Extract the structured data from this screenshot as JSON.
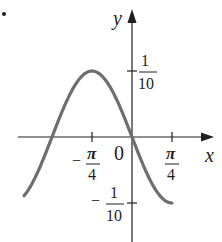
{
  "figure": {
    "label": "6."
  },
  "colors": {
    "axis": "#231f20",
    "curve": "#6d6e71",
    "background": "#ffffff"
  },
  "chart_data": {
    "type": "line",
    "title": "",
    "xlabel": "x",
    "ylabel": "y",
    "function": "y = -(1/10) sin(2x)",
    "x_ticks": [
      {
        "value": -0.7854,
        "label": "-π/4"
      },
      {
        "value": 0,
        "label": "0"
      },
      {
        "value": 0.7854,
        "label": "π/4"
      }
    ],
    "y_ticks": [
      {
        "value": 0.1,
        "label": "1/10"
      },
      {
        "value": -0.1,
        "label": "-1/10"
      }
    ],
    "xlim": [
      -2.0,
      1.2
    ],
    "ylim": [
      -0.16,
      0.19
    ],
    "grid": false,
    "legend": null,
    "series": [
      {
        "name": "curve",
        "x": [
          -2.12,
          -1.9635,
          -1.5708,
          -1.1781,
          -0.7854,
          -0.3927,
          0,
          0.3927,
          0.7854
        ],
        "y": [
          -0.0894,
          -0.0707,
          0,
          0.0707,
          0.1,
          0.0707,
          0,
          -0.0707,
          -0.1
        ]
      }
    ]
  },
  "labels": {
    "y_axis": "y",
    "x_axis": "x",
    "origin": "0",
    "y_tick_pos_num": "1",
    "y_tick_pos_den": "10",
    "y_tick_neg_sign": "−",
    "y_tick_neg_num": "1",
    "y_tick_neg_den": "10",
    "x_tick_neg_sign": "−",
    "x_tick_neg_num": "π",
    "x_tick_neg_den": "4",
    "x_tick_pos_num": "π",
    "x_tick_pos_den": "4"
  }
}
